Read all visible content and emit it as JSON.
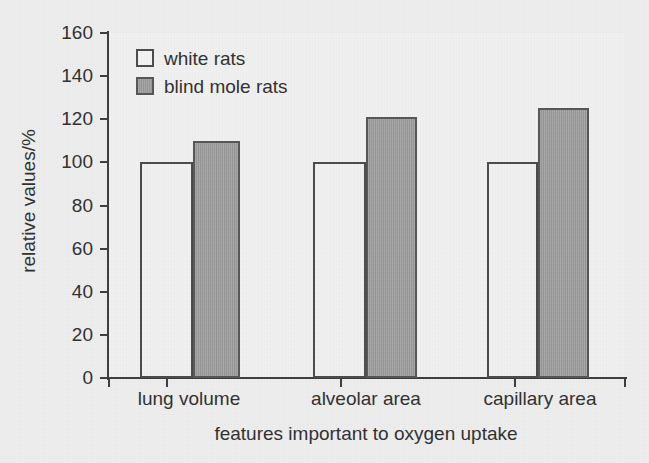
{
  "figure": {
    "title_clipped": "oxygen uptake",
    "background_color": "#eeeeee",
    "plot_background_color": "#f1f1f1",
    "axis_color": "#3c3c3c"
  },
  "legend": {
    "position": "top-left-inside",
    "entries": [
      {
        "label": "white rats",
        "fill": "#f4f4f4",
        "stroke": "#4a4a4a"
      },
      {
        "label": "blind mole rats",
        "fill": "#9d9d9d",
        "stroke": "#555555"
      }
    ]
  },
  "chart_data": {
    "type": "bar",
    "title": "",
    "xlabel": "features important to oxygen uptake",
    "ylabel": "relative values/%",
    "categories": [
      "lung volume",
      "alveolar area",
      "capillary area"
    ],
    "series": [
      {
        "name": "white rats",
        "values": [
          100,
          100,
          100
        ],
        "color": "#f1f1f1"
      },
      {
        "name": "blind mole rats",
        "values": [
          110,
          121,
          125
        ],
        "color": "#9d9d9d"
      }
    ],
    "ylim": [
      0,
      160
    ],
    "ytick_step": 20,
    "yticks": [
      0,
      20,
      40,
      60,
      80,
      100,
      120,
      140,
      160
    ],
    "ytick_labels": [
      "0",
      "20",
      "40",
      "60",
      "80",
      "100",
      "120",
      "140",
      "160"
    ],
    "grid": false,
    "legend_position": "upper left"
  }
}
